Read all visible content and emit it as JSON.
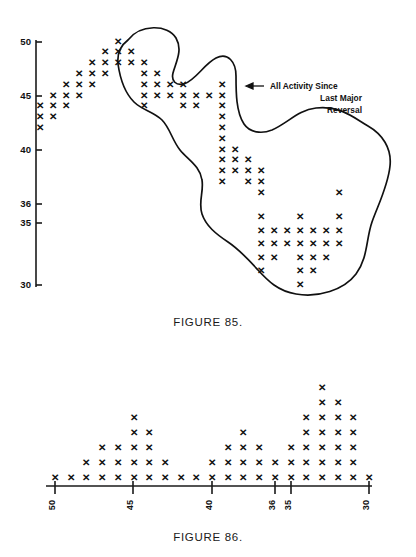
{
  "figures": {
    "top": {
      "caption": "FIGURE 85.",
      "annotation": {
        "line1": "All Activity Since",
        "line2": "Last Major",
        "line3": "Reversal",
        "arrow": "left-arrow-icon"
      }
    },
    "bottom": {
      "caption": "FIGURE 86."
    }
  },
  "chart_data": [
    {
      "id": "figure-85",
      "type": "scatter",
      "title": "FIGURE 85.",
      "xlabel": "",
      "ylabel": "",
      "marker": "X",
      "grid": false,
      "legend": null,
      "annotations": [
        {
          "text": "All Activity Since Last Major Reversal",
          "lines": [
            "All Activity Since",
            "Last Major",
            "Reversal"
          ],
          "arrow": "left",
          "points_to": "enclosing outline of congestion area"
        }
      ],
      "yaxis": {
        "ticks": [
          50,
          45,
          40,
          36,
          35,
          30
        ],
        "ylim": [
          29,
          51
        ],
        "note": "price scale, descending downward; 36 and 35 are adjacent boxes"
      },
      "xaxis": {
        "note": "unlabeled column index (time / vertical-count columns), left to right",
        "columns": 24
      },
      "outline": {
        "name": "congestion-area-outline",
        "description": "free-hand closed curve enclosing all activity since the last major reversal"
      },
      "columns": [
        {
          "col": 1,
          "values": [
            44,
            43,
            42
          ]
        },
        {
          "col": 2,
          "values": [
            45,
            44,
            43
          ]
        },
        {
          "col": 3,
          "values": [
            46,
            45,
            44
          ]
        },
        {
          "col": 4,
          "values": [
            47,
            46,
            45
          ]
        },
        {
          "col": 5,
          "values": [
            48,
            47,
            46
          ]
        },
        {
          "col": 6,
          "values": [
            49,
            48,
            47
          ]
        },
        {
          "col": 7,
          "values": [
            50,
            49,
            48
          ]
        },
        {
          "col": 8,
          "values": [
            49,
            48
          ]
        },
        {
          "col": 9,
          "values": [
            48,
            47,
            46,
            45,
            44
          ]
        },
        {
          "col": 10,
          "values": [
            47,
            46,
            45
          ]
        },
        {
          "col": 11,
          "values": [
            46,
            45
          ]
        },
        {
          "col": 12,
          "values": [
            46,
            45,
            44
          ]
        },
        {
          "col": 13,
          "values": [
            45,
            44
          ]
        },
        {
          "col": 14,
          "values": [
            45
          ]
        },
        {
          "col": 15,
          "values": [
            46,
            45,
            44,
            43,
            42,
            41,
            40,
            39,
            38,
            37
          ]
        },
        {
          "col": 16,
          "values": [
            40,
            39,
            38
          ]
        },
        {
          "col": 17,
          "values": [
            39,
            38,
            37
          ]
        },
        {
          "col": 18,
          "values": [
            38,
            37,
            36,
            35,
            34,
            33,
            32,
            31
          ]
        },
        {
          "col": 19,
          "values": [
            34,
            33,
            32
          ]
        },
        {
          "col": 20,
          "values": [
            34,
            33
          ]
        },
        {
          "col": 21,
          "values": [
            35,
            34,
            33,
            32,
            31,
            30
          ]
        },
        {
          "col": 22,
          "values": [
            34,
            33,
            32,
            31
          ]
        },
        {
          "col": 23,
          "values": [
            34,
            33,
            32
          ]
        },
        {
          "col": 24,
          "values": [
            36,
            35,
            34,
            33
          ]
        }
      ]
    },
    {
      "id": "figure-86",
      "type": "bar",
      "title": "FIGURE 86.",
      "xlabel": "",
      "ylabel": "",
      "marker": "X",
      "grid": false,
      "legend": null,
      "note": "vertical-count histogram: each X is one unit of column height stacked upward from the axis",
      "xaxis": {
        "ticks": [
          50,
          45,
          40,
          36,
          35,
          30
        ],
        "tick_orientation": "vertical",
        "xlim": [
          50,
          30
        ],
        "direction": "descending left-to-right"
      },
      "categories": [
        50,
        49,
        48,
        47,
        46,
        45,
        44,
        43,
        42,
        41,
        40,
        39,
        38,
        37,
        36,
        35,
        34,
        33,
        32,
        31,
        30
      ],
      "values": [
        1,
        1,
        2,
        3,
        3,
        5,
        4,
        2,
        1,
        1,
        2,
        3,
        4,
        3,
        2,
        3,
        5,
        7,
        6,
        5,
        1
      ],
      "ylim": [
        0,
        8
      ]
    }
  ]
}
